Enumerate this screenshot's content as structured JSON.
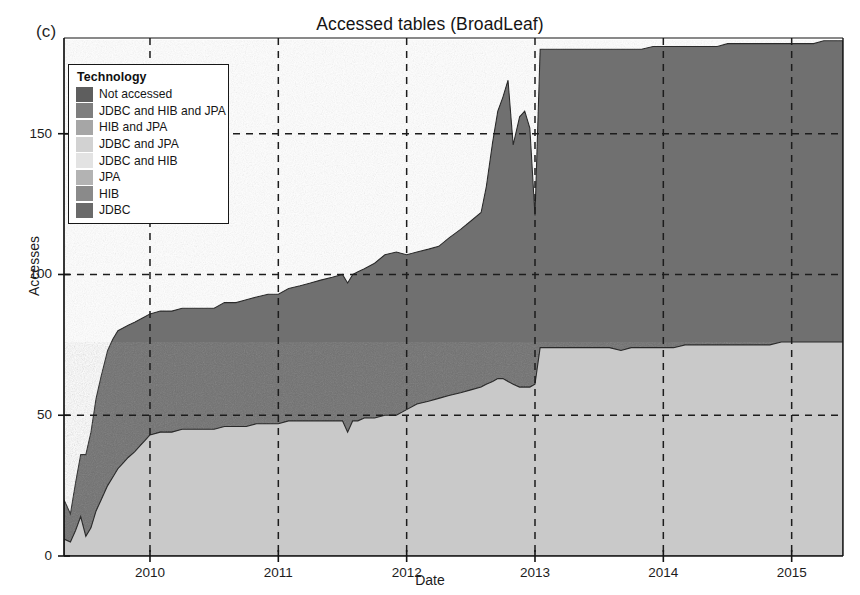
{
  "figure": {
    "panel_label": "(c)",
    "title": "Accessed tables (BroadLeaf)",
    "background": "#ffffff"
  },
  "legend": {
    "title": "Technology",
    "position": "top-left inside plot",
    "entries": [
      {
        "label": "Not accessed",
        "color": "#5e5e5e"
      },
      {
        "label": "JDBC and HIB and JPA",
        "color": "#7e7e7e"
      },
      {
        "label": "HIB and JPA",
        "color": "#a6a6a6"
      },
      {
        "label": "JDBC and JPA",
        "color": "#d2d2d2"
      },
      {
        "label": "JDBC and HIB",
        "color": "#e3e3e3"
      },
      {
        "label": "JPA",
        "color": "#b3b3b3"
      },
      {
        "label": "HIB",
        "color": "#8a8a8a"
      },
      {
        "label": "JDBC",
        "color": "#6a6a6a"
      }
    ]
  },
  "axes": {
    "x": {
      "label": "Date",
      "ticks": [
        "2010",
        "2011",
        "2012",
        "2013",
        "2014",
        "2015"
      ],
      "tick_values": [
        2010,
        2011,
        2012,
        2013,
        2014,
        2015
      ],
      "range": [
        2009.33,
        2015.4
      ],
      "grid": "dashed"
    },
    "y": {
      "label": "Accesses",
      "ticks": [
        "0",
        "50",
        "100",
        "150"
      ],
      "tick_values": [
        0,
        50,
        100,
        150
      ],
      "range": [
        0,
        184
      ],
      "grid": "dashed"
    }
  },
  "chart_data": {
    "type": "area",
    "stacked": true,
    "title": "Accessed tables (BroadLeaf)",
    "xlabel": "Date",
    "ylabel": "Accesses",
    "xlim": [
      2009.33,
      2015.4
    ],
    "ylim": [
      0,
      184
    ],
    "grid": true,
    "legend_position": "upper-left",
    "x": [
      2009.33,
      2009.38,
      2009.42,
      2009.46,
      2009.5,
      2009.54,
      2009.58,
      2009.62,
      2009.67,
      2009.71,
      2009.75,
      2009.79,
      2009.83,
      2009.88,
      2009.92,
      2009.96,
      2010.0,
      2010.08,
      2010.17,
      2010.25,
      2010.33,
      2010.42,
      2010.5,
      2010.58,
      2010.67,
      2010.75,
      2010.83,
      2010.92,
      2011.0,
      2011.08,
      2011.17,
      2011.25,
      2011.33,
      2011.42,
      2011.5,
      2011.54,
      2011.58,
      2011.62,
      2011.67,
      2011.75,
      2011.83,
      2011.92,
      2012.0,
      2012.08,
      2012.17,
      2012.25,
      2012.33,
      2012.42,
      2012.5,
      2012.58,
      2012.62,
      2012.67,
      2012.71,
      2012.75,
      2012.79,
      2012.83,
      2012.88,
      2012.92,
      2012.96,
      2013.0,
      2013.04,
      2013.08,
      2013.17,
      2013.25,
      2013.33,
      2013.42,
      2013.5,
      2013.58,
      2013.67,
      2013.75,
      2013.83,
      2013.92,
      2014.0,
      2014.08,
      2014.17,
      2014.25,
      2014.33,
      2014.42,
      2014.5,
      2014.58,
      2014.67,
      2014.75,
      2014.83,
      2014.92,
      2015.0,
      2015.08,
      2015.17,
      2015.25,
      2015.33,
      2015.4
    ],
    "series": [
      {
        "name": "JDBC",
        "color": "#c9c9c9",
        "values": [
          6,
          5,
          9,
          14,
          7,
          10,
          16,
          20,
          25,
          28,
          31,
          33,
          35,
          37,
          39,
          41,
          43,
          44,
          44,
          45,
          45,
          45,
          45,
          46,
          46,
          46,
          47,
          47,
          47,
          48,
          48,
          48,
          48,
          48,
          48,
          44,
          48,
          48,
          49,
          49,
          50,
          50,
          52,
          54,
          55,
          56,
          57,
          58,
          59,
          60,
          61,
          62,
          63,
          63,
          62,
          61,
          60,
          60,
          60,
          61,
          74,
          74,
          74,
          74,
          74,
          74,
          74,
          74,
          73,
          74,
          74,
          74,
          74,
          74,
          75,
          75,
          75,
          75,
          75,
          75,
          75,
          75,
          75,
          76,
          76,
          76,
          76,
          76,
          76,
          76
        ]
      },
      {
        "name": "Not accessed",
        "color": "#707070",
        "values": [
          14,
          10,
          17,
          22,
          29,
          34,
          40,
          44,
          48,
          49,
          49,
          48,
          47,
          46,
          45,
          44,
          43,
          43,
          43,
          43,
          43,
          43,
          43,
          44,
          44,
          45,
          45,
          46,
          46,
          47,
          48,
          49,
          50,
          51,
          52,
          53,
          52,
          53,
          53,
          55,
          57,
          58,
          55,
          54,
          54,
          54,
          56,
          58,
          60,
          62,
          70,
          85,
          95,
          100,
          107,
          85,
          96,
          98,
          92,
          60,
          106,
          106,
          106,
          106,
          106,
          106,
          106,
          106,
          107,
          106,
          106,
          107,
          107,
          107,
          106,
          106,
          106,
          106,
          107,
          107,
          107,
          107,
          107,
          106,
          106,
          106,
          106,
          107,
          107,
          107
        ]
      }
    ],
    "totals_note": "Stacked total rises from ~20 in mid-2009 to ~182 by 2015",
    "series_present_in_plot": [
      "JDBC",
      "Not accessed"
    ],
    "series_zero_in_plot": [
      "JDBC and HIB and JPA",
      "HIB and JPA",
      "JDBC and JPA",
      "JDBC and HIB",
      "JPA",
      "HIB"
    ]
  }
}
